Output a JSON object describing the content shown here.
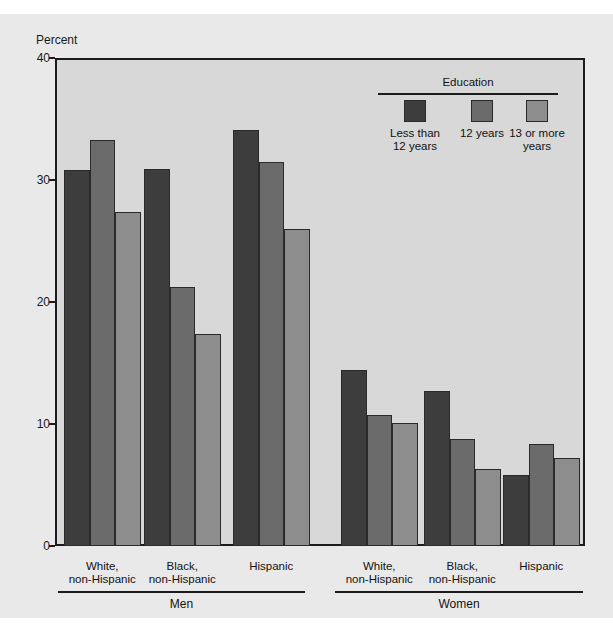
{
  "chart_data": {
    "type": "bar",
    "title": "",
    "xlabel": "",
    "ylabel": "Percent",
    "ylim": [
      0,
      40
    ],
    "yticks": [
      0,
      10,
      20,
      30,
      40
    ],
    "ytick_labels": [
      "0",
      "10",
      "20",
      "30",
      "40"
    ],
    "grid": false,
    "legend": {
      "title": "Education",
      "position": "upper-right-inside",
      "entries": [
        {
          "name": "Less than 12 years",
          "label_line1": "Less than",
          "label_line2": "12 years",
          "color": "#3d3d3d"
        },
        {
          "name": "12 years",
          "label_line1": "12 years",
          "label_line2": "",
          "color": "#6b6b6b"
        },
        {
          "name": "13 or more years",
          "label_line1": "13 or more",
          "label_line2": "years",
          "color": "#8d8d8d"
        }
      ]
    },
    "groups": [
      {
        "name": "Men",
        "categories": [
          {
            "line1": "White,",
            "line2": "non-Hispanic"
          },
          {
            "line1": "Black,",
            "line2": "non-Hispanic"
          },
          {
            "line1": "Hispanic",
            "line2": ""
          }
        ]
      },
      {
        "name": "Women",
        "categories": [
          {
            "line1": "White,",
            "line2": "non-Hispanic"
          },
          {
            "line1": "Black,",
            "line2": "non-Hispanic"
          },
          {
            "line1": "Hispanic",
            "line2": ""
          }
        ]
      }
    ],
    "series": [
      {
        "name": "Less than 12 years",
        "values": [
          30.8,
          30.9,
          34.1,
          14.4,
          12.7,
          5.8
        ]
      },
      {
        "name": "12 years",
        "values": [
          33.3,
          21.2,
          31.5,
          10.7,
          8.8,
          8.4
        ]
      },
      {
        "name": "13 or more years",
        "values": [
          27.4,
          17.4,
          26.0,
          10.1,
          6.3,
          7.2
        ]
      }
    ],
    "x_categories": [
      "Men / White, non-Hispanic",
      "Men / Black, non-Hispanic",
      "Men / Hispanic",
      "Women / White, non-Hispanic",
      "Women / Black, non-Hispanic",
      "Women / Hispanic"
    ],
    "colors": {
      "plot_background": "#d8d8d8",
      "figure_background": "#e9e9e9",
      "axis": "#1b1b1b",
      "bar_edge": "#2a2a2a"
    }
  }
}
